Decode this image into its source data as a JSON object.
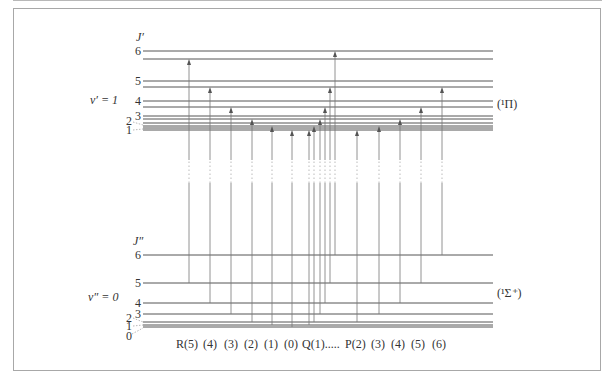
{
  "diagram": {
    "title_upper_axis": "J′",
    "title_lower_axis": "J″",
    "upper_state": {
      "vib_label": "v′ = 1",
      "term_label": "(¹Π)"
    },
    "lower_state": {
      "vib_label": "v″ = 0",
      "term_label": "(¹Σ⁺)"
    },
    "x_start": 143,
    "x_end": 493,
    "upper_levels": [
      {
        "J": "1",
        "y": [
          128,
          130
        ]
      },
      {
        "J": "2",
        "y": [
          123,
          126
        ]
      },
      {
        "J": "3",
        "y": [
          116,
          119
        ]
      },
      {
        "J": "4",
        "y": [
          101,
          107
        ]
      },
      {
        "J": "5",
        "y": [
          81,
          87
        ]
      },
      {
        "J": "6",
        "y": [
          51,
          59
        ]
      }
    ],
    "lower_levels": [
      {
        "J": "0",
        "y": 327
      },
      {
        "J": "1",
        "y": 325
      },
      {
        "J": "2",
        "y": 322
      },
      {
        "J": "3",
        "y": 314
      },
      {
        "J": "4",
        "y": 303
      },
      {
        "J": "5",
        "y": 283
      },
      {
        "J": "6",
        "y": 255
      }
    ],
    "transitions": [
      {
        "branch": "R",
        "x": 189,
        "from_J": 5,
        "to_J": 6,
        "y_from": 283,
        "y_to": 60
      },
      {
        "branch": "R",
        "x": 210,
        "from_J": 4,
        "to_J": 5,
        "y_from": 303,
        "y_to": 88
      },
      {
        "branch": "R",
        "x": 231,
        "from_J": 3,
        "to_J": 4,
        "y_from": 314,
        "y_to": 108
      },
      {
        "branch": "R",
        "x": 252,
        "from_J": 2,
        "to_J": 3,
        "y_from": 322,
        "y_to": 120
      },
      {
        "branch": "R",
        "x": 272,
        "from_J": 1,
        "to_J": 2,
        "y_from": 325,
        "y_to": 127
      },
      {
        "branch": "R",
        "x": 292,
        "from_J": 0,
        "to_J": 1,
        "y_from": 327,
        "y_to": 131
      },
      {
        "branch": "Q",
        "x": 309,
        "from_J": 1,
        "to_J": 1,
        "y_from": 325,
        "y_to": 131
      },
      {
        "branch": "Q",
        "x": 314,
        "from_J": 2,
        "to_J": 2,
        "y_from": 322,
        "y_to": 127
      },
      {
        "branch": "Q",
        "x": 320,
        "from_J": 3,
        "to_J": 3,
        "y_from": 314,
        "y_to": 120
      },
      {
        "branch": "Q",
        "x": 325,
        "from_J": 4,
        "to_J": 4,
        "y_from": 303,
        "y_to": 108
      },
      {
        "branch": "Q",
        "x": 330,
        "from_J": 5,
        "to_J": 5,
        "y_from": 283,
        "y_to": 88
      },
      {
        "branch": "Q",
        "x": 335,
        "from_J": 6,
        "to_J": 6,
        "y_from": 255,
        "y_to": 52
      },
      {
        "branch": "P",
        "x": 357,
        "from_J": 2,
        "to_J": 1,
        "y_from": 322,
        "y_to": 131
      },
      {
        "branch": "P",
        "x": 379,
        "from_J": 3,
        "to_J": 2,
        "y_from": 314,
        "y_to": 127
      },
      {
        "branch": "P",
        "x": 400,
        "from_J": 4,
        "to_J": 3,
        "y_from": 303,
        "y_to": 120
      },
      {
        "branch": "P",
        "x": 421,
        "from_J": 5,
        "to_J": 4,
        "y_from": 283,
        "y_to": 108
      },
      {
        "branch": "P",
        "x": 442,
        "from_J": 6,
        "to_J": 5,
        "y_from": 255,
        "y_to": 88
      }
    ],
    "gap": {
      "y_top": 160,
      "y_bottom": 183
    },
    "bottom_labels": [
      {
        "text": "R(5)",
        "x": 176
      },
      {
        "text": "(4)",
        "x": 203
      },
      {
        "text": "(3)",
        "x": 224
      },
      {
        "text": "(2)",
        "x": 244
      },
      {
        "text": "(1)",
        "x": 264
      },
      {
        "text": "(0)",
        "x": 284
      },
      {
        "text": "Q(1).....",
        "x": 302
      },
      {
        "text": "P(2)",
        "x": 345
      },
      {
        "text": "(3)",
        "x": 371
      },
      {
        "text": "(4)",
        "x": 391
      },
      {
        "text": "(5)",
        "x": 411
      },
      {
        "text": "(6)",
        "x": 432
      }
    ]
  }
}
